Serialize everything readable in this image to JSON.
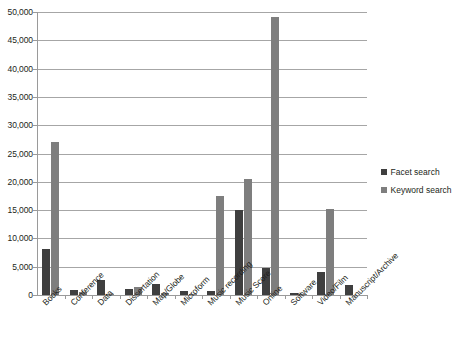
{
  "chart_data": {
    "type": "bar",
    "title": "",
    "subtitle": "",
    "xlabel": "",
    "ylabel": "",
    "ylim": [
      0,
      50000
    ],
    "ytick_values": [
      0,
      5000,
      10000,
      15000,
      20000,
      25000,
      30000,
      35000,
      40000,
      45000,
      50000
    ],
    "ytick_labels": [
      "0",
      "5,000",
      "10,000",
      "15,000",
      "20,000",
      "25,000",
      "30,000",
      "35,000",
      "40,000",
      "45,000",
      "50,000"
    ],
    "grid": true,
    "legend_position": "right",
    "categories": [
      "Books",
      "Conference",
      "Data",
      "Dissertation",
      "Map/Globe",
      "Microform",
      "Music recording",
      "Music Score",
      "Online",
      "Software",
      "Video/Film",
      "Manuscript/Archive"
    ],
    "series": [
      {
        "name": "Facet search",
        "color": "#3f3f3f",
        "values": [
          8200,
          900,
          2700,
          1100,
          1900,
          700,
          700,
          15000,
          4700,
          400,
          4000,
          1700
        ]
      },
      {
        "name": "Keyword search",
        "color": "#7e7e7e",
        "values": [
          27000,
          600,
          200,
          1500,
          400,
          100,
          17500,
          20500,
          49200,
          100,
          15200,
          0
        ]
      }
    ]
  },
  "legend": {
    "items": [
      {
        "label": "Facet search"
      },
      {
        "label": "Keyword search"
      }
    ]
  }
}
